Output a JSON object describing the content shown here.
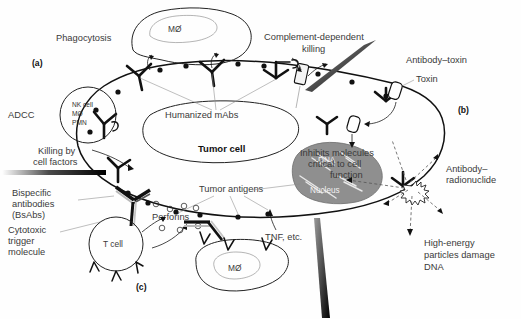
{
  "figure": {
    "panels": [
      {
        "id": "a",
        "label": "(a)"
      },
      {
        "id": "b",
        "label": "(b)"
      },
      {
        "id": "c",
        "label": "(c)"
      }
    ],
    "colors": {
      "ink": "#111111",
      "label_text": "#3a3a3a",
      "nucleus_fill": "#8f8f8f",
      "dna_strand": "#e8e8e8",
      "background": "#ffffff"
    }
  },
  "labels": {
    "phagocytosis": "Phagocytosis",
    "macrophage_top": "MØ",
    "macrophage_bottom": "MØ",
    "adcc": "ADCC",
    "effector_nk": "NK cell",
    "effector_mo": "MØ",
    "effector_pmn": "PMN",
    "killing_line1": "Killing by",
    "killing_line2": "cell factors",
    "humanized_mabs": "Humanized mAbs",
    "complement_line1": "Complement-dependent",
    "complement_line2": "killing",
    "antibody_toxin": "Antibody–toxin",
    "toxin": "Toxin",
    "inhibits_line1": "Inhibits molecules",
    "inhibits_line2": "critical to cell",
    "inhibits_line3": "function",
    "tumor_cell": "Tumor cell",
    "tumor_antigens": "Tumor antigens",
    "dna": "DNA",
    "nucleus": "Nucleus",
    "antibody_radionuclide_line1": "Antibody–",
    "antibody_radionuclide_line2": "radionuclide",
    "high_energy_line1": "High-energy",
    "high_energy_line2": "particles damage",
    "high_energy_line3": "DNA",
    "bispecific_line1": "Bispecific",
    "bispecific_line2": "antibodies",
    "bispecific_line3": "(BsAbs)",
    "cytotoxic_line1": "Cytotoxic",
    "cytotoxic_line2": "trigger",
    "cytotoxic_line3": "molecule",
    "t_cell": "T cell",
    "perforins": "Perforins",
    "tnf": "TNF, etc."
  },
  "icons": {
    "antibody": "antibody-y-icon",
    "antigen": "antigen-dot-icon",
    "pore": "membrane-pore-icon",
    "toxin_capsule": "toxin-capsule-icon",
    "radionuclide": "radionuclide-burst-icon",
    "perforin": "perforin-pore-icon"
  }
}
